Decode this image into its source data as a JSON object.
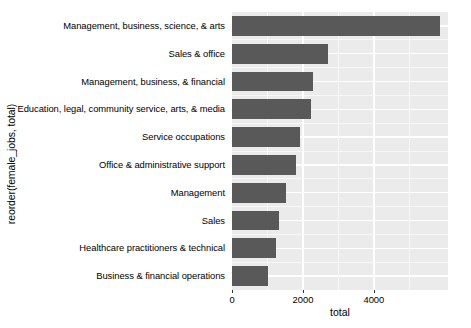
{
  "chart_data": {
    "type": "bar",
    "orientation": "horizontal",
    "title": "",
    "xlabel": "total",
    "ylabel": "reorder(female_jobs, total)",
    "categories": [
      "Management, business, science, & arts",
      "Sales & office",
      "Management, business, & financial",
      "Education, legal, community service, arts, & media",
      "Service occupations",
      "Office & administrative support",
      "Management",
      "Sales",
      "Healthcare practitioners & technical",
      "Business & financial operations"
    ],
    "values": [
      5860,
      2700,
      2280,
      2225,
      1915,
      1800,
      1520,
      1325,
      1240,
      1015
    ],
    "xlim": [
      0,
      6090
    ],
    "xticks": [
      0,
      2000,
      4000
    ],
    "xtick_labels": [
      "0",
      "2000",
      "4000"
    ],
    "x_minor_ticks": [
      1000,
      3000,
      5000
    ],
    "grid": true,
    "legend": null,
    "colors": {
      "bar_fill": "#595959",
      "panel_background": "#ebebeb",
      "grid_major": "#ffffff",
      "grid_minor": "#f7f7f7",
      "text": "#000000",
      "page_background": "#ffffff"
    }
  }
}
